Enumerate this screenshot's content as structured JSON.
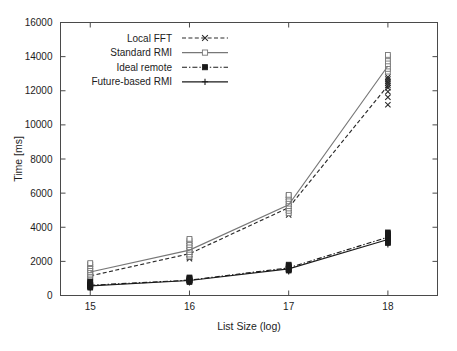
{
  "chart_data": {
    "type": "line",
    "title": "",
    "xlabel": "List Size (log)",
    "ylabel": "Time [ms]",
    "xlim": [
      14.7,
      18.5
    ],
    "ylim": [
      0,
      16000
    ],
    "xticks": [
      15,
      16,
      17,
      18
    ],
    "yticks": [
      0,
      2000,
      4000,
      6000,
      8000,
      10000,
      12000,
      14000,
      16000
    ],
    "grid": false,
    "legend_position": "top-left-inside",
    "x": [
      15,
      16,
      17,
      18
    ],
    "series": [
      {
        "name": "Local FFT",
        "marker": "cross",
        "line": "dashed",
        "color": "#2b2b2b",
        "values": [
          1150,
          2450,
          5150,
          12300
        ],
        "scatter": [
          {
            "x": 15,
            "points": [
              1000,
              1080,
              1140,
              1200,
              1260,
              1340,
              1420,
              1560,
              1700,
              1820
            ]
          },
          {
            "x": 16,
            "points": [
              2150,
              2250,
              2340,
              2420,
              2520,
              2640,
              2760,
              2900,
              3050,
              3180
            ]
          },
          {
            "x": 17,
            "points": [
              4720,
              4850,
              4980,
              5100,
              5220,
              5340,
              5480,
              5620,
              5760,
              5860
            ]
          },
          {
            "x": 18,
            "points": [
              11180,
              11620,
              11950,
              12180,
              12320,
              12450,
              12560,
              12680,
              12800,
              13400
            ]
          }
        ]
      },
      {
        "name": "Standard RMI",
        "marker": "open-square",
        "line": "solid",
        "color": "#777777",
        "values": [
          1380,
          2660,
          5320,
          13450
        ],
        "scatter": [
          {
            "x": 15,
            "points": [
              1080,
              1180,
              1280,
              1380,
              1480,
              1600,
              1720,
              1840,
              1900
            ]
          },
          {
            "x": 16,
            "points": [
              2280,
              2400,
              2540,
              2680,
              2820,
              2960,
              3100,
              3240,
              3320
            ]
          },
          {
            "x": 17,
            "points": [
              4820,
              4960,
              5100,
              5240,
              5380,
              5520,
              5660,
              5800,
              5900
            ]
          },
          {
            "x": 18,
            "points": [
              13120,
              13280,
              13420,
              13560,
              13720,
              13880,
              14020,
              14100
            ]
          }
        ]
      },
      {
        "name": "Ideal remote",
        "marker": "filled-square",
        "line": "dash-dot",
        "color": "#1a1a1a",
        "values": [
          600,
          900,
          1620,
          3420
        ],
        "scatter": [
          {
            "x": 15,
            "points": [
              460,
              500,
              540,
              580,
              620,
              660,
              700,
              760,
              820
            ]
          },
          {
            "x": 16,
            "points": [
              790,
              830,
              870,
              900,
              940,
              980,
              1020,
              1060
            ]
          },
          {
            "x": 17,
            "points": [
              1460,
              1510,
              1560,
              1610,
              1660,
              1710,
              1760,
              1810
            ]
          },
          {
            "x": 18,
            "points": [
              3080,
              3180,
              3280,
              3380,
              3460,
              3540,
              3620,
              3700
            ]
          }
        ]
      },
      {
        "name": "Future-based RMI",
        "marker": "plus",
        "line": "solid",
        "color": "#1a1a1a",
        "values": [
          560,
          880,
          1560,
          3280
        ],
        "scatter": [
          {
            "x": 15,
            "points": [
              440,
              480,
              520,
              560,
              600,
              640,
              690,
              740
            ]
          },
          {
            "x": 16,
            "points": [
              760,
              800,
              840,
              880,
              920,
              960,
              1000
            ]
          },
          {
            "x": 17,
            "points": [
              1400,
              1450,
              1500,
              1550,
              1600,
              1650,
              1700
            ]
          },
          {
            "x": 18,
            "points": [
              2980,
              3080,
              3180,
              3280,
              3380,
              3480,
              3560
            ]
          }
        ]
      }
    ]
  },
  "axes": {
    "y_title": "Time [ms]",
    "x_title": "List Size (log)",
    "y_tick_labels": [
      "0",
      "2000",
      "4000",
      "6000",
      "8000",
      "10000",
      "12000",
      "14000",
      "16000"
    ],
    "x_tick_labels": [
      "15",
      "16",
      "17",
      "18"
    ]
  },
  "legend": {
    "entries": [
      {
        "label": "Local FFT"
      },
      {
        "label": "Standard RMI"
      },
      {
        "label": "Ideal remote"
      },
      {
        "label": "Future-based RMI"
      }
    ]
  }
}
